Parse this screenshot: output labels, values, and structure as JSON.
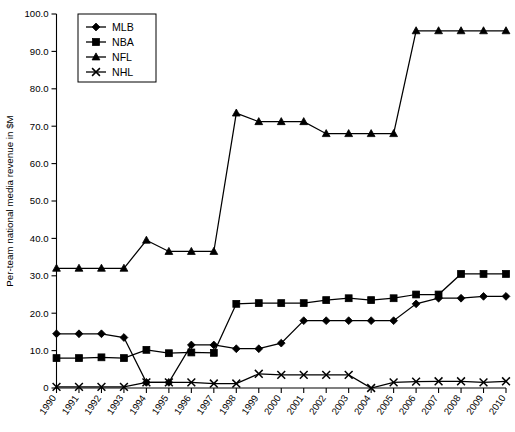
{
  "chart_data": {
    "type": "line",
    "title": "",
    "xlabel": "",
    "ylabel": "Per-team national media revenue in $M",
    "xlim": [
      1990,
      2010
    ],
    "ylim": [
      0,
      100
    ],
    "ytick_labels": [
      "0",
      "10.0",
      "20.0",
      "30.0",
      "40.0",
      "50.0",
      "60.0",
      "70.0",
      "80.0",
      "90.0",
      "100.0"
    ],
    "ytick_values": [
      0,
      10,
      20,
      30,
      40,
      50,
      60,
      70,
      80,
      90,
      100
    ],
    "grid": false,
    "legend_position": "top-left",
    "categories": [
      "1990",
      "1991",
      "1992",
      "1993",
      "1994",
      "1995",
      "1996",
      "1997",
      "1998",
      "1999",
      "2000",
      "2001",
      "2002",
      "2003",
      "2004",
      "2005",
      "2006",
      "2007",
      "2008",
      "2009",
      "2010"
    ],
    "series": [
      {
        "name": "MLB",
        "marker": "diamond",
        "values": [
          14.5,
          14.5,
          14.5,
          13.5,
          1.5,
          1.5,
          11.5,
          11.5,
          10.5,
          10.5,
          12.0,
          18.0,
          18.0,
          18.0,
          18.0,
          18.0,
          22.5,
          24.0,
          24.0,
          24.5,
          24.5
        ]
      },
      {
        "name": "NBA",
        "marker": "square",
        "values": [
          8.0,
          8.0,
          8.2,
          8.0,
          10.2,
          9.3,
          9.5,
          9.4,
          22.5,
          22.7,
          22.7,
          22.7,
          23.5,
          24.0,
          23.5,
          24.0,
          25.0,
          25.0,
          30.5,
          30.5,
          30.5
        ]
      },
      {
        "name": "NFL",
        "marker": "triangle",
        "values": [
          32.0,
          32.0,
          32.0,
          32.0,
          39.5,
          36.5,
          36.5,
          36.5,
          73.5,
          71.2,
          71.2,
          71.2,
          68.0,
          68.0,
          68.0,
          68.0,
          95.5,
          95.5,
          95.5,
          95.5,
          95.5
        ]
      },
      {
        "name": "NHL",
        "marker": "x",
        "values": [
          0.3,
          0.3,
          0.3,
          0.3,
          1.5,
          1.5,
          1.5,
          1.2,
          1.2,
          3.8,
          3.5,
          3.5,
          3.5,
          3.5,
          0.0,
          1.5,
          1.7,
          1.8,
          1.8,
          1.5,
          1.8
        ]
      }
    ]
  },
  "caption": {
    "text": ""
  }
}
